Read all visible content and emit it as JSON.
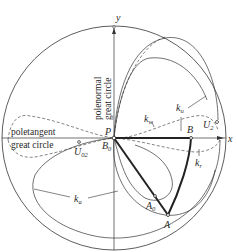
{
  "figure": {
    "type": "stereographic projection diagram",
    "axes": {
      "x_label": "x",
      "y_label": "y"
    },
    "curve_labels": {
      "polenormal_line1": "polenormal",
      "polenormal_line2": "great circle",
      "poletangent_line1": "poletangent",
      "poletangent_line2": "great circle",
      "k_u": "k",
      "k_u_sub": "u",
      "k_w": "k",
      "k_w_sub": "w",
      "k_r": "k",
      "k_r_sub": "r",
      "k_a": "k",
      "k_a_sub": "a"
    },
    "points": {
      "P": "P",
      "B0": "B",
      "B0_sub": "0",
      "B": "B",
      "U2": "U",
      "U2_sub": "2",
      "U02": "U",
      "U02_sub": "02",
      "A0": "A",
      "A0_sub": "0",
      "A": "A"
    },
    "colors": {
      "line": "#2a2a2a",
      "background": "#ffffff"
    }
  }
}
